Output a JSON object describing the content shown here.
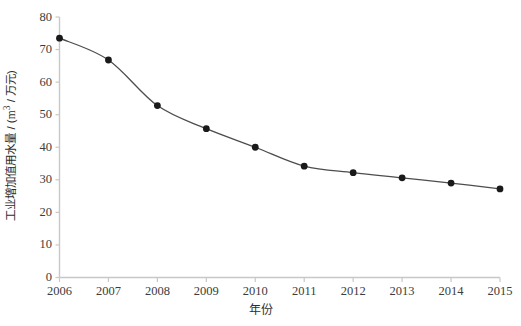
{
  "chart_data": {
    "type": "line",
    "title": "",
    "subtitle": "",
    "xlabel": "年份",
    "ylabel": "工业增加值用水量 / (m³ / 万元)",
    "ylabel_main": "工业增加值用水量 / (",
    "ylabel_unit_num": "m",
    "ylabel_unit_sup": "3",
    "ylabel_unit_rest": " / 万元)",
    "categories": [
      "2006",
      "2007",
      "2008",
      "2009",
      "2010",
      "2011",
      "2012",
      "2013",
      "2014",
      "2015"
    ],
    "x": [
      2006,
      2007,
      2008,
      2009,
      2010,
      2011,
      2012,
      2013,
      2014,
      2015
    ],
    "values": [
      73.5,
      66.8,
      52.8,
      45.7,
      40.0,
      34.2,
      32.2,
      30.6,
      29.0,
      27.2
    ],
    "series": [
      {
        "name": "工业增加值用水量",
        "values": [
          73.5,
          66.8,
          52.8,
          45.7,
          40.0,
          34.2,
          32.2,
          30.6,
          29.0,
          27.2
        ]
      }
    ],
    "ylim": [
      0,
      80
    ],
    "xlim": [
      2006,
      2015
    ],
    "y_ticks": [
      0,
      10,
      20,
      30,
      40,
      50,
      60,
      70,
      80
    ],
    "y_tick_labels": [
      "0",
      "10",
      "20",
      "30",
      "40",
      "50",
      "60",
      "70",
      "80"
    ],
    "x_ticks": [
      2006,
      2007,
      2008,
      2009,
      2010,
      2011,
      2012,
      2013,
      2014,
      2015
    ],
    "grid": false,
    "legend": false,
    "legend_position": "none",
    "marker": "filled-circle",
    "line_style": "smooth",
    "colors": {
      "line": "#4d4d4d",
      "marker": "#1a1a1a",
      "axis": "#c8c8c8",
      "text": "#3c3c3c",
      "background": "#ffffff"
    }
  }
}
